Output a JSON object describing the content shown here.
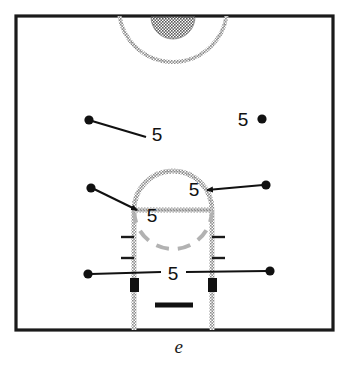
{
  "figure": {
    "caption": "e",
    "diagram_type": "basketball-court-half-diagram",
    "colors": {
      "ink": "#111111",
      "court_line": "#b8b8b8",
      "background": "#ffffff",
      "marker_fill": "#111111"
    },
    "court": {
      "border": {
        "x": 16,
        "y": 16,
        "width": 317,
        "height": 314
      },
      "center_circle": {
        "cx": 173,
        "cy": 8,
        "r": 54,
        "label": "center-circle-arc"
      },
      "center_circle_inner": {
        "cx": 173,
        "cy": 8,
        "r": 22,
        "label": "center-circle-inner-shaded"
      },
      "free_throw_circle": {
        "cx": 173,
        "cy": 210,
        "r": 39,
        "label": "free-throw-circle"
      },
      "free_throw_line": {
        "x1": 134,
        "y1": 210,
        "x2": 212,
        "y2": 210
      },
      "lane_left_x": 134,
      "lane_right_x": 212,
      "lane_bottom_y": 330,
      "backboard": {
        "x1": 155,
        "y1": 305,
        "x2": 193,
        "y2": 305
      }
    },
    "lane_ticks": [
      {
        "side": "left",
        "y": 237
      },
      {
        "side": "left",
        "y": 258
      },
      {
        "side": "right",
        "y": 237
      },
      {
        "side": "right",
        "y": 258
      }
    ],
    "block_markers": [
      {
        "name": "left-lane-block",
        "x": 130,
        "y": 278,
        "width": 9,
        "height": 14
      },
      {
        "name": "right-lane-block",
        "x": 208,
        "y": 278,
        "width": 9,
        "height": 14
      }
    ],
    "annotations": [
      {
        "id": "a1",
        "label": "5",
        "label_x": 157,
        "label_y": 141,
        "dot": {
          "x": 89,
          "y": 120
        },
        "line": {
          "x1": 92,
          "y1": 121,
          "x2": 145,
          "y2": 136
        },
        "arrow": false,
        "name": "annotation-upper-left"
      },
      {
        "id": "a2",
        "label": "5",
        "label_x": 243,
        "label_y": 126,
        "dot": {
          "x": 262,
          "y": 119
        },
        "line": null,
        "arrow": false,
        "name": "annotation-upper-right"
      },
      {
        "id": "a3",
        "label": "5",
        "label_x": 152,
        "label_y": 222,
        "dot": {
          "x": 91,
          "y": 188
        },
        "line": {
          "x1": 94,
          "y1": 189,
          "x2": 139,
          "y2": 211
        },
        "arrow": true,
        "name": "annotation-free-throw-line-left"
      },
      {
        "id": "a4",
        "label": "5",
        "label_x": 194,
        "label_y": 196,
        "dot": {
          "x": 266,
          "y": 185
        },
        "line": {
          "x1": 263,
          "y1": 185,
          "x2": 208,
          "y2": 190
        },
        "arrow": true,
        "name": "annotation-free-throw-circle-right"
      },
      {
        "id": "a5",
        "label": "5",
        "label_x": 173,
        "label_y": 280,
        "dot": {
          "x": 88,
          "y": 274
        },
        "dot2": {
          "x": 270,
          "y": 271
        },
        "line": {
          "x1": 91,
          "y1": 274,
          "x2": 160,
          "y2": 272
        },
        "line2": {
          "x1": 186,
          "y1": 272,
          "x2": 267,
          "y2": 271
        },
        "arrow": false,
        "name": "annotation-baseline-width"
      }
    ],
    "dimension_value": "5"
  }
}
